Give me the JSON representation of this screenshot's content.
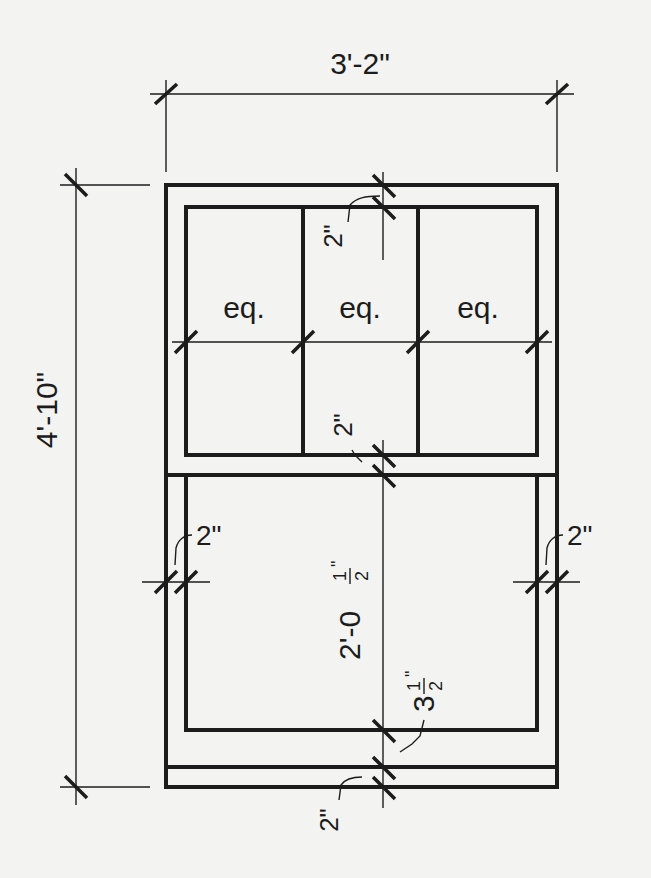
{
  "drawing": {
    "title": "Double-hung window elevation with dimensions",
    "overall_width": "3'-2\"",
    "overall_height": "4'-10\"",
    "upper_sash": {
      "top_rail_gap": "2\"",
      "pane_labels": [
        "eq.",
        "eq.",
        "eq."
      ],
      "meeting_rail_gap": "2\""
    },
    "lower_sash": {
      "left_gap": "2\"",
      "right_gap": "2\"",
      "height": "2'-0",
      "height_fraction_num": "1",
      "height_fraction_den": "2",
      "height_inch_mark": "\"",
      "bottom_rail": "3",
      "bottom_rail_fraction_num": "1",
      "bottom_rail_fraction_den": "2",
      "bottom_rail_inch_mark": "\""
    },
    "sill_gap": "2\"",
    "ink_color": "#1c1c1c",
    "paper_color": "#f3f3f1"
  }
}
